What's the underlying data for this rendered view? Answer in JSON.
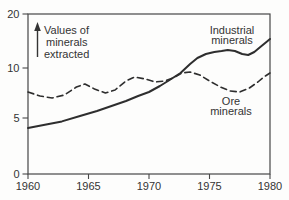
{
  "chart_data": {
    "type": "line",
    "title": "",
    "annotation": {
      "line1": "Values of",
      "line2": "minerals",
      "line3": "extracted",
      "arrow": "up-arrow"
    },
    "x_axis": {
      "label": "",
      "tick_labels": [
        "1960",
        "1965",
        "1970",
        "1975",
        "1980"
      ],
      "range": [
        1960,
        1980
      ]
    },
    "y_axis": {
      "label": "",
      "tick_labels": [
        "20",
        "10",
        "5",
        "0"
      ],
      "range_drawn": [
        0,
        20
      ],
      "scale_note": "schematic sketch axis; 10-20 interval drawn compressed"
    },
    "grid": false,
    "legend_position": "inline-labels",
    "colors": {
      "line": "#2e2e2e",
      "text": "#343434",
      "frame": "#474747"
    },
    "series": [
      {
        "name": "Industrial minerals",
        "label_lines": [
          "Industrial",
          "minerals"
        ],
        "style": "solid",
        "x": [
          1960,
          1961.4,
          1962.8,
          1964.3,
          1965.7,
          1966.9,
          1968.1,
          1969.1,
          1970,
          1970.9,
          1971.7,
          1972.6,
          1973.4,
          1974,
          1974.7,
          1975.4,
          1976,
          1976.5,
          1977.1,
          1977.7,
          1978.2,
          1978.7,
          1979.2,
          1979.7,
          1980
        ],
        "values": [
          4.1,
          4.4,
          4.7,
          5.2,
          5.7,
          6.2,
          6.7,
          7.2,
          7.6,
          8.2,
          8.8,
          9.5,
          10.4,
          11.0,
          11.4,
          11.6,
          11.7,
          11.8,
          11.7,
          11.4,
          11.3,
          11.6,
          12.1,
          12.6,
          12.9
        ]
      },
      {
        "name": "Ore minerals",
        "label_lines": [
          "Ore",
          "minerals"
        ],
        "style": "dashed",
        "x": [
          1960,
          1961,
          1962,
          1963,
          1964,
          1964.7,
          1965.5,
          1966.4,
          1967.2,
          1968.1,
          1968.8,
          1969.7,
          1970.5,
          1971.3,
          1972,
          1972.7,
          1973.4,
          1974.2,
          1975,
          1975.9,
          1976.7,
          1977.5,
          1978.3,
          1979,
          1979.5,
          1980
        ],
        "values": [
          7.6,
          7.2,
          7.0,
          7.3,
          8.1,
          8.4,
          7.9,
          7.5,
          7.8,
          8.7,
          9.1,
          8.9,
          8.6,
          8.7,
          9.0,
          9.5,
          9.6,
          9.3,
          8.7,
          8.1,
          7.7,
          7.6,
          8.0,
          8.6,
          9.1,
          9.5
        ]
      }
    ]
  }
}
